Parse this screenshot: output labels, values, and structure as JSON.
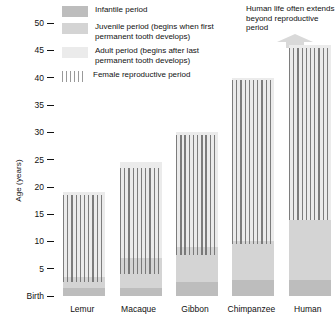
{
  "chart_data": {
    "type": "bar",
    "title": "",
    "xlabel": "",
    "ylabel": "Age (years)",
    "ylim": [
      0,
      52
    ],
    "grid": false,
    "legend_position": "top-left",
    "y_ticks": [
      {
        "value": 50,
        "label": "50"
      },
      {
        "value": 45,
        "label": "45"
      },
      {
        "value": 40,
        "label": "40"
      },
      {
        "value": 35,
        "label": "35"
      },
      {
        "value": 30,
        "label": "30"
      },
      {
        "value": 25,
        "label": "25"
      },
      {
        "value": 20,
        "label": "20"
      },
      {
        "value": 15,
        "label": "15"
      },
      {
        "value": 10,
        "label": "10"
      },
      {
        "value": 5,
        "label": "5"
      },
      {
        "value": 0,
        "label": "Birth"
      }
    ],
    "categories": [
      "Lemur",
      "Macaque",
      "Gibbon",
      "Chimpanzee",
      "Human"
    ],
    "series": [
      {
        "name": "Infantile period",
        "values": [
          1.5,
          1.5,
          2.5,
          3.0,
          3.0
        ]
      },
      {
        "name": "Juvenile period",
        "values": [
          2.0,
          5.5,
          6.5,
          7.0,
          11.0
        ]
      },
      {
        "name": "Adult period",
        "values": [
          15.5,
          17.5,
          21.0,
          30.0,
          32.0
        ]
      }
    ],
    "totals": [
      19,
      24.5,
      30,
      40,
      46
    ],
    "female_reproductive_period": [
      {
        "category": "Lemur",
        "start": 2.5,
        "end": 18.5
      },
      {
        "category": "Macaque",
        "start": 4.0,
        "end": 23.5
      },
      {
        "category": "Gibbon",
        "start": 7.5,
        "end": 29.5
      },
      {
        "category": "Chimpanzee",
        "start": 9.5,
        "end": 39.5
      },
      {
        "category": "Human",
        "start": 14.0,
        "end": 45.5
      }
    ]
  },
  "axis": {
    "y_title": "Age (years)"
  },
  "legend": {
    "items": [
      {
        "swatch": "infantile",
        "label": "Infantile period"
      },
      {
        "swatch": "juvenile",
        "label": "Juvenile period (begins when first permanent tooth develops)"
      },
      {
        "swatch": "adult",
        "label": "Adult period (begins after last permanent tooth develops)"
      },
      {
        "swatch": "reproductive",
        "label": "Female reproductive period"
      }
    ]
  },
  "annotation": {
    "text": "Human life often extends beyond reproductive period",
    "icon": "up-arrow-icon"
  },
  "colors": {
    "infantile": "#bdbdbd",
    "juvenile": "#d4d4d4",
    "adult": "#ebebeb",
    "reproductive_hatch": "#696969",
    "text": "#111111",
    "background": "#ffffff"
  }
}
